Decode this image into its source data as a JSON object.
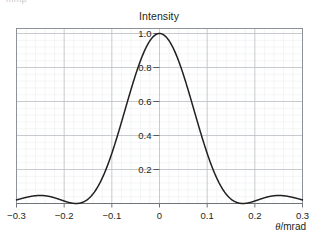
{
  "figure": {
    "cut_text": "mmp",
    "title": "Intensity",
    "x_axis_title_symbol": "θ",
    "x_axis_title_rest": "/mrad"
  },
  "chart_data": {
    "type": "line",
    "title": "Intensity",
    "xlabel": "θ/mrad",
    "ylabel": "Intensity",
    "xlim": [
      -0.3,
      0.3
    ],
    "ylim": [
      0,
      1.06
    ],
    "grid": true,
    "minor_grid": true,
    "legend": false,
    "x_ticks": [
      -0.3,
      -0.2,
      -0.1,
      0,
      0.1,
      0.2,
      0.3
    ],
    "x_tick_labels": [
      "−0.3",
      "−0.2",
      "−0.1",
      "0",
      "0.1",
      "0.2",
      "0.3"
    ],
    "y_ticks": [
      0.2,
      0.4,
      0.6,
      0.8,
      1.0
    ],
    "y_tick_labels": [
      "0.2",
      "0.4",
      "0.6",
      "0.8",
      "1.0"
    ],
    "y_minor_per_major": 5,
    "x_minor_per_major": 5,
    "curve_color": "#231f20",
    "grid_color": "#b9bec4",
    "minor_grid_color": "#e8eaec",
    "axis_color": "#8d9299",
    "series": [
      {
        "name": "Intensity",
        "first_zero": 0.175,
        "peak_value": 1.0,
        "peak_x": 0,
        "secondary_peak_value": 0.047,
        "secondary_peak_x": 0.25,
        "x": [
          -0.3,
          -0.29,
          -0.28,
          -0.27,
          -0.26,
          -0.25,
          -0.24,
          -0.23,
          -0.22,
          -0.21,
          -0.2,
          -0.19,
          -0.18,
          -0.175,
          -0.17,
          -0.16,
          -0.15,
          -0.14,
          -0.13,
          -0.12,
          -0.11,
          -0.1,
          -0.09,
          -0.08,
          -0.07,
          -0.06,
          -0.05,
          -0.04,
          -0.03,
          -0.02,
          -0.01,
          0.0,
          0.01,
          0.02,
          0.03,
          0.04,
          0.05,
          0.06,
          0.07,
          0.08,
          0.09,
          0.1,
          0.11,
          0.12,
          0.13,
          0.14,
          0.15,
          0.16,
          0.17,
          0.175,
          0.18,
          0.19,
          0.2,
          0.21,
          0.22,
          0.23,
          0.24,
          0.25,
          0.26,
          0.27,
          0.28,
          0.29,
          0.3
        ],
        "values": [
          0.015,
          0.026,
          0.036,
          0.043,
          0.047,
          0.047,
          0.044,
          0.038,
          0.03,
          0.021,
          0.013,
          0.006,
          0.001,
          0.0,
          0.001,
          0.007,
          0.02,
          0.041,
          0.071,
          0.111,
          0.161,
          0.222,
          0.292,
          0.371,
          0.456,
          0.545,
          0.635,
          0.723,
          0.805,
          0.877,
          0.937,
          1.0,
          0.937,
          0.877,
          0.805,
          0.723,
          0.635,
          0.545,
          0.456,
          0.371,
          0.292,
          0.222,
          0.161,
          0.111,
          0.071,
          0.041,
          0.02,
          0.007,
          0.001,
          0.0,
          0.001,
          0.006,
          0.013,
          0.021,
          0.03,
          0.038,
          0.044,
          0.047,
          0.047,
          0.043,
          0.036,
          0.026,
          0.015
        ]
      }
    ]
  }
}
